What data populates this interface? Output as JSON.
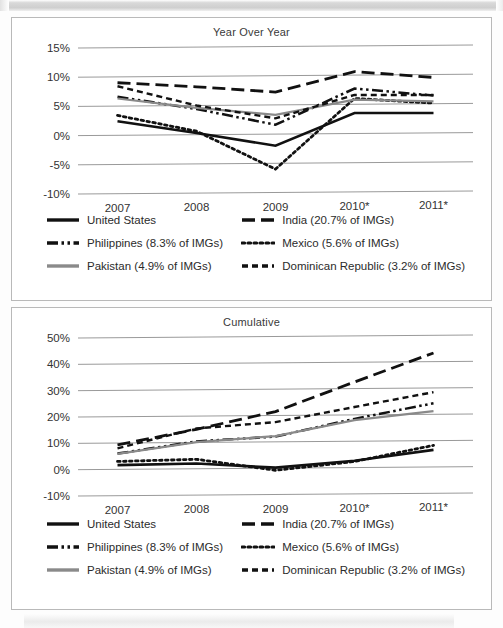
{
  "document": {
    "title": "IMG Year Over Year and Cumulative Growth"
  },
  "series_styles": {
    "united_states": {
      "color": "#111111",
      "dash": "none",
      "width": 2.6
    },
    "india": {
      "color": "#111111",
      "dash": "long-dash",
      "width": 2.8
    },
    "philippines": {
      "color": "#111111",
      "dash": "dash-dot-dot",
      "width": 2.5
    },
    "mexico": {
      "color": "#111111",
      "dash": "dotted",
      "width": 2.8
    },
    "pakistan": {
      "color": "#8a8a8a",
      "dash": "none",
      "width": 2.2
    },
    "dominican_republic": {
      "color": "#111111",
      "dash": "short-dash",
      "width": 2.4
    }
  },
  "legend": {
    "items": [
      {
        "key": "united_states",
        "label": "United States",
        "swatch": "solid-black-line"
      },
      {
        "key": "india",
        "label": "India (20.7% of IMGs)",
        "swatch": "long-dash-line"
      },
      {
        "key": "philippines",
        "label": "Philippines (8.3% of IMGs)",
        "swatch": "dash-dot-dot-line"
      },
      {
        "key": "mexico",
        "label": "Mexico (5.6% of IMGs)",
        "swatch": "dotted-line"
      },
      {
        "key": "pakistan",
        "label": "Pakistan (4.9% of IMGs)",
        "swatch": "solid-gray-line"
      },
      {
        "key": "dominican_republic",
        "label": "Dominican Republic (3.2% of IMGs)",
        "swatch": "short-dash-line"
      }
    ]
  },
  "chart_data": [
    {
      "id": "year-over-year",
      "type": "line",
      "title": "Year Over Year",
      "xlabel": "",
      "ylabel": "",
      "x": [
        "2007",
        "2008",
        "2009",
        "2010*",
        "2011*"
      ],
      "ylim": [
        -10,
        15
      ],
      "yticks": [
        15,
        10,
        5,
        0,
        -5,
        -10
      ],
      "ytick_labels": [
        "15%",
        "10%",
        "5%",
        "0%",
        "-5%",
        "-10%"
      ],
      "grid": true,
      "legend_position": "below",
      "series": [
        {
          "name": "United States",
          "key": "united_states",
          "values": [
            2.4,
            0.3,
            -2.0,
            3.5,
            3.4
          ]
        },
        {
          "name": "India (20.7% of IMGs)",
          "key": "india",
          "values": [
            9.0,
            8.2,
            7.2,
            10.6,
            9.5
          ]
        },
        {
          "name": "Philippines (8.3% of IMGs)",
          "key": "philippines",
          "values": [
            6.6,
            4.4,
            1.6,
            7.7,
            6.4
          ]
        },
        {
          "name": "Mexico (5.6% of IMGs)",
          "key": "mexico",
          "values": [
            3.4,
            0.6,
            -6.0,
            6.0,
            5.1
          ]
        },
        {
          "name": "Pakistan (4.9% of IMGs)",
          "key": "pakistan",
          "values": [
            6.3,
            4.6,
            3.3,
            5.8,
            5.4
          ]
        },
        {
          "name": "Dominican Republic (3.2% of IMGs)",
          "key": "dominican_republic",
          "values": [
            8.4,
            5.0,
            2.7,
            6.6,
            6.5
          ]
        }
      ]
    },
    {
      "id": "cumulative",
      "type": "line",
      "title": "Cumulative",
      "xlabel": "",
      "ylabel": "",
      "x": [
        "2007",
        "2008",
        "2009",
        "2010*",
        "2011*"
      ],
      "ylim": [
        -10,
        50
      ],
      "yticks": [
        50,
        40,
        30,
        20,
        10,
        0,
        -10
      ],
      "ytick_labels": [
        "50%",
        "40%",
        "30%",
        "20%",
        "10%",
        "0%",
        "-10%"
      ],
      "grid": true,
      "legend_position": "below",
      "series": [
        {
          "name": "United States",
          "key": "united_states",
          "values": [
            1.6,
            2.0,
            0.2,
            2.6,
            6.5
          ]
        },
        {
          "name": "India (20.7% of IMGs)",
          "key": "india",
          "values": [
            9.3,
            15.0,
            21.5,
            32.5,
            43.3
          ]
        },
        {
          "name": "Philippines (8.3% of IMGs)",
          "key": "philippines",
          "values": [
            6.0,
            10.4,
            12.0,
            18.5,
            24.2
          ]
        },
        {
          "name": "Mexico (5.6% of IMGs)",
          "key": "mexico",
          "values": [
            3.0,
            3.6,
            -0.8,
            2.3,
            8.2
          ]
        },
        {
          "name": "Pakistan (4.9% of IMGs)",
          "key": "pakistan",
          "values": [
            5.9,
            10.1,
            12.2,
            18.0,
            21.2
          ]
        },
        {
          "name": "Dominican Republic (3.2% of IMGs)",
          "key": "dominican_republic",
          "values": [
            8.0,
            15.3,
            17.5,
            23.0,
            28.4
          ]
        }
      ]
    }
  ]
}
